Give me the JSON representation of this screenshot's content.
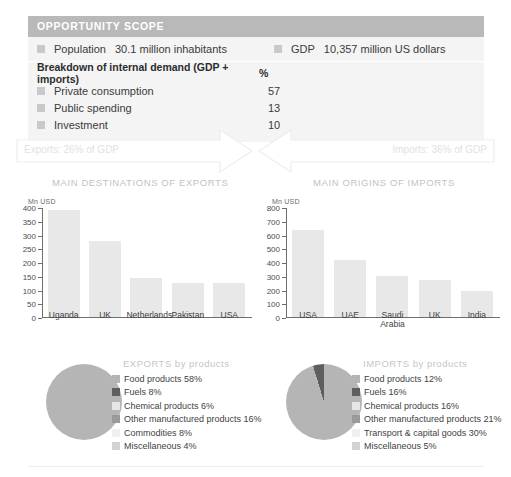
{
  "scope": {
    "header": "OPPORTUNITY SCOPE",
    "stats": [
      {
        "label": "Population",
        "value": "30.1 million inhabitants"
      },
      {
        "label": "GDP",
        "value": "10,357 million US dollars"
      }
    ],
    "breakdown_title": "Breakdown of internal demand (GDP + imports)",
    "breakdown_unit": "%",
    "breakdown": [
      {
        "label": "Private consumption",
        "value": "57"
      },
      {
        "label": "Public spending",
        "value": "13"
      },
      {
        "label": "Investment",
        "value": "10"
      }
    ]
  },
  "flows": {
    "exports_arrow": "Exports: 26% of GDP",
    "imports_arrow": "Imports: 36% of GDP"
  },
  "sections": {
    "exports_title": "MAIN DESTINATIONS OF EXPORTS",
    "imports_title": "MAIN ORIGINS OF IMPORTS"
  },
  "chart_data": [
    {
      "type": "bar",
      "title": "MAIN DESTINATIONS OF EXPORTS",
      "xlabel": "",
      "ylabel": "Mn USD",
      "unit": "Mn USD",
      "categories": [
        "Uganda",
        "UK",
        "Netherlands",
        "Pakistan",
        "USA"
      ],
      "values": [
        390,
        277,
        142,
        124,
        125
      ],
      "yticks": [
        0,
        50,
        100,
        150,
        200,
        250,
        300,
        350,
        400
      ],
      "ylim": [
        0,
        400
      ],
      "grid": false,
      "legend": "none"
    },
    {
      "type": "bar",
      "title": "MAIN ORIGINS OF IMPORTS",
      "xlabel": "",
      "ylabel": "Mn USD",
      "unit": "Mn USD",
      "categories": [
        "USA",
        "UAE",
        "Saudi Arabia",
        "UK",
        "India"
      ],
      "values": [
        635,
        415,
        300,
        268,
        190
      ],
      "yticks": [
        0,
        100,
        200,
        300,
        400,
        500,
        600,
        700,
        800
      ],
      "ylim": [
        0,
        800
      ],
      "grid": false,
      "legend": "none"
    },
    {
      "type": "pie",
      "title": "EXPORTS by products",
      "legend_position": "right",
      "labels": [
        "Food products 58%",
        "Fuels 8%",
        "Chemical products 6%",
        "Other manufactured products 16%",
        "Commodities 8%",
        "Miscellaneous 4%"
      ],
      "categories": [
        "Food products",
        "Fuels",
        "Chemical products",
        "Other manufactured products",
        "Commodities",
        "Miscellaneous"
      ],
      "values": [
        58,
        8,
        6,
        16,
        8,
        4
      ],
      "colors": [
        "#b5b5b5",
        "#5e5e5e",
        "#e6e6e6",
        "#9a9a9a",
        "#f0f0f0",
        "#d2d2d2"
      ]
    },
    {
      "type": "pie",
      "title": "IMPORTS by products",
      "legend_position": "right",
      "labels": [
        "Food products 12%",
        "Fuels 16%",
        "Chemical products 16%",
        "Other manufactured products 21%",
        "Transport & capital goods 30%",
        "Miscellaneous 5%"
      ],
      "categories": [
        "Food products",
        "Fuels",
        "Chemical products",
        "Other manufactured products",
        "Transport & capital goods",
        "Miscellaneous"
      ],
      "values": [
        12,
        16,
        16,
        21,
        30,
        5
      ],
      "colors": [
        "#b5b5b5",
        "#5e5e5e",
        "#e6e6e6",
        "#9a9a9a",
        "#f0f0f0",
        "#d2d2d2"
      ]
    }
  ],
  "colors": {
    "header_bar": "#b9b9b9",
    "panel_bg": "#f4f4f4",
    "bar_fill": "#e8e8e8",
    "muted_title": "#c2c2c2",
    "arrow_outline": "#ededed"
  }
}
